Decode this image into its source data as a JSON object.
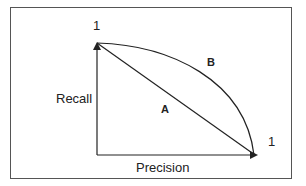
{
  "diagram": {
    "y_axis_label": "Recall",
    "x_axis_label": "Precision",
    "y_axis_max_label": "1",
    "x_axis_max_label": "1",
    "curve_a_label": "A",
    "curve_b_label": "B",
    "colors": {
      "line": "#222222",
      "frame": "#555555",
      "background": "#ffffff"
    }
  }
}
